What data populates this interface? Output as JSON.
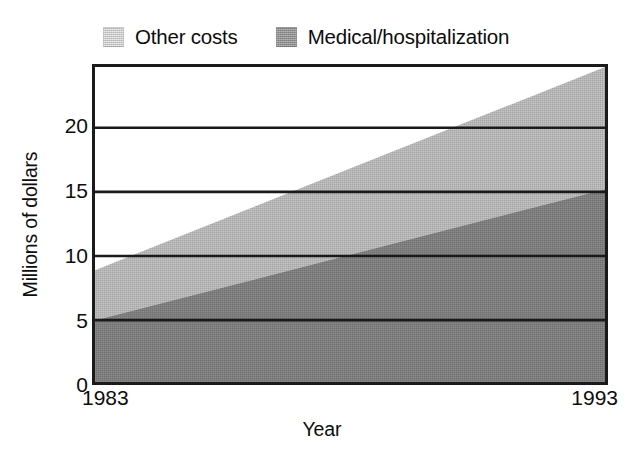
{
  "chart_data": {
    "type": "area",
    "stacked": true,
    "title": "",
    "subtitle": "",
    "xlabel": "Year",
    "ylabel": "Millions of dollars",
    "x": [
      1983,
      1993
    ],
    "xlim": [
      1983,
      1993
    ],
    "ylim": [
      0,
      24.5
    ],
    "yticks": [
      0,
      5,
      10,
      15,
      20
    ],
    "ytick_labels": [
      "0",
      "5",
      "10",
      "15",
      "20"
    ],
    "xtick_labels": [
      "1983",
      "1993"
    ],
    "grid": "horizontal",
    "legend_position": "top",
    "series": [
      {
        "name": "Medical/hospitalization",
        "values": [
          4.8,
          15.0
        ],
        "color": "#7d7d7d",
        "stack_order": 1
      },
      {
        "name": "Other costs",
        "values": [
          3.9,
          9.5
        ],
        "cumulative_top": [
          8.7,
          24.5
        ],
        "color": "#b4b4b4",
        "stack_order": 2
      }
    ],
    "annotations": []
  },
  "legend": {
    "entries": [
      {
        "label": "Other costs",
        "swatch": "light-gray-swatch-icon"
      },
      {
        "label": "Medical/hospitalization",
        "swatch": "dark-gray-swatch-icon"
      }
    ]
  },
  "axes": {
    "y_title": "Millions of dollars",
    "x_title": "Year",
    "y_ticks": [
      "20",
      "15",
      "10",
      "5",
      "0"
    ],
    "x_ticks": {
      "left": "1983",
      "right": "1993"
    }
  },
  "colors": {
    "other_costs": "#b4b4b4",
    "medical": "#7d7d7d",
    "frame": "#1a1a1a",
    "background": "#ffffff"
  }
}
